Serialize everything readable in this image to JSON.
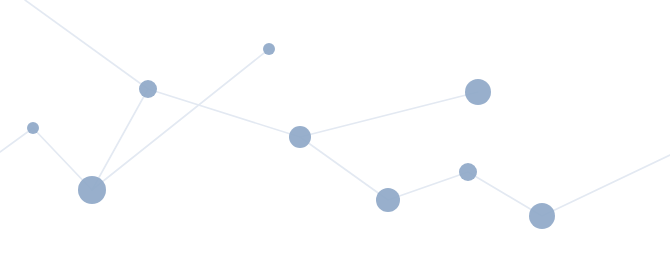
{
  "figure": {
    "type": "node-link-diagram",
    "width": 670,
    "height": 257,
    "background_color": "#ffffff",
    "node_color": "#8fa8c8",
    "node_opacity": 0.92,
    "edge_color": "#e3e9f2",
    "edge_width": 1.6
  },
  "chart_data": {
    "type": "scatter",
    "title": "",
    "xlabel": "",
    "ylabel": "",
    "xlim": [
      0,
      670
    ],
    "ylim": [
      0,
      257
    ],
    "grid": false,
    "legend": null,
    "nodes": [
      {
        "id": "n1",
        "x": 33,
        "y": 128,
        "r": 6,
        "size": "small"
      },
      {
        "id": "n2",
        "x": 92,
        "y": 190,
        "r": 14,
        "size": "large"
      },
      {
        "id": "n3",
        "x": 148,
        "y": 89,
        "r": 9,
        "size": "medium"
      },
      {
        "id": "n4",
        "x": 269,
        "y": 49,
        "r": 6,
        "size": "small"
      },
      {
        "id": "n5",
        "x": 300,
        "y": 137,
        "r": 11,
        "size": "medium"
      },
      {
        "id": "n6",
        "x": 388,
        "y": 200,
        "r": 12,
        "size": "medium-large"
      },
      {
        "id": "n7",
        "x": 468,
        "y": 172,
        "r": 9,
        "size": "medium"
      },
      {
        "id": "n8",
        "x": 478,
        "y": 92,
        "r": 13,
        "size": "large"
      },
      {
        "id": "n9",
        "x": 542,
        "y": 216,
        "r": 13,
        "size": "large"
      }
    ],
    "edges": [
      {
        "from": "edge-left-out",
        "x1": 0,
        "y1": 152,
        "x2": 33,
        "y2": 128
      },
      {
        "from": "n1",
        "to": "n2",
        "x1": 33,
        "y1": 128,
        "x2": 92,
        "y2": 190
      },
      {
        "from": "n2",
        "to": "n3",
        "x1": 92,
        "y1": 190,
        "x2": 148,
        "y2": 89
      },
      {
        "from": "n2",
        "to": "n4",
        "x1": 92,
        "y1": 190,
        "x2": 269,
        "y2": 49
      },
      {
        "from": "n3",
        "to": "top-left-out",
        "x1": 148,
        "y1": 89,
        "x2": 25,
        "y2": 0
      },
      {
        "from": "n3",
        "to": "n5",
        "x1": 148,
        "y1": 89,
        "x2": 300,
        "y2": 137
      },
      {
        "from": "n5",
        "to": "n8",
        "x1": 300,
        "y1": 137,
        "x2": 478,
        "y2": 92
      },
      {
        "from": "n5",
        "to": "n6",
        "x1": 300,
        "y1": 137,
        "x2": 388,
        "y2": 200
      },
      {
        "from": "n6",
        "to": "n7",
        "x1": 388,
        "y1": 200,
        "x2": 468,
        "y2": 172
      },
      {
        "from": "n7",
        "to": "n9",
        "x1": 468,
        "y1": 172,
        "x2": 542,
        "y2": 216
      },
      {
        "from": "n9",
        "to": "right-out",
        "x1": 542,
        "y1": 216,
        "x2": 670,
        "y2": 155
      }
    ]
  }
}
